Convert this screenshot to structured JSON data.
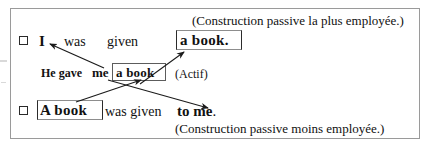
{
  "document": {
    "type": "grammar-diagram",
    "language": "fr",
    "topic": "English passive voice constructions"
  },
  "lines": {
    "passive_primary": {
      "checkbox_state": "unchecked",
      "subject": "I",
      "aux": "was",
      "participle": "given",
      "object_boxed": "a book.",
      "annotation": "(Construction passive la plus employée.)"
    },
    "active": {
      "lead": "He  gave",
      "indirect_object": "me",
      "direct_object_boxed": "a book",
      "annotation": "(Actif)"
    },
    "passive_secondary": {
      "checkbox_state": "unchecked",
      "subject_boxed": "A book",
      "aux_participle": "was  given",
      "complement": "to me",
      "final_punctuation": ".",
      "annotation": "(Construction passive moins employée.)"
    }
  },
  "arrows": [
    {
      "name": "me-to-I",
      "from": "active.indirect_object",
      "to": "passive_primary.subject"
    },
    {
      "name": "abook-to-abook-up",
      "from": "active.direct_object_boxed",
      "to": "passive_primary.object_boxed"
    },
    {
      "name": "Abook-to-abook",
      "from": "passive_secondary.subject_boxed",
      "to": "active.direct_object_boxed"
    },
    {
      "name": "me-to-tome",
      "from": "active.indirect_object",
      "to": "passive_secondary.complement"
    }
  ],
  "colors": {
    "ink": "#111111",
    "frame": "#9a9a9a",
    "box_stroke": "#2b2b2b",
    "background": "#ffffff"
  }
}
